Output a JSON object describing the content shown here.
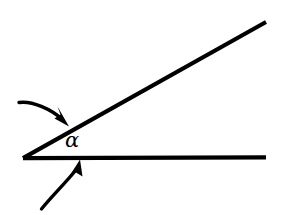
{
  "figure": {
    "name": "angle-diagram",
    "background_color": "#ffffff",
    "ink_color": "#000000",
    "width": 282,
    "height": 215
  },
  "labels": {
    "angle_symbol": "α"
  },
  "geometry": {
    "vertex": {
      "x": 23,
      "y": 158
    },
    "horizontal_ray": {
      "name": "horizontal-ray",
      "x1": 23,
      "y1": 158,
      "x2": 266,
      "y2": 157,
      "stroke_width": 4.2
    },
    "upper_ray": {
      "name": "upper-ray",
      "x1": 23,
      "y1": 158,
      "x2": 266,
      "y2": 22,
      "stroke_width": 4.2
    },
    "upper_arrow": {
      "name": "upper-arrow",
      "path": "M 19 103 C 33 101, 52 110, 63 120",
      "stroke_width": 3.2,
      "head_points": "68,125 55,117 60,114 58,108"
    },
    "lower_arrow": {
      "name": "lower-arrow",
      "path": "M 42 209 C 52 196, 66 182, 76 169",
      "stroke_width": 3.2,
      "head_points": "79,160 83,175 77,172 71,177"
    }
  }
}
